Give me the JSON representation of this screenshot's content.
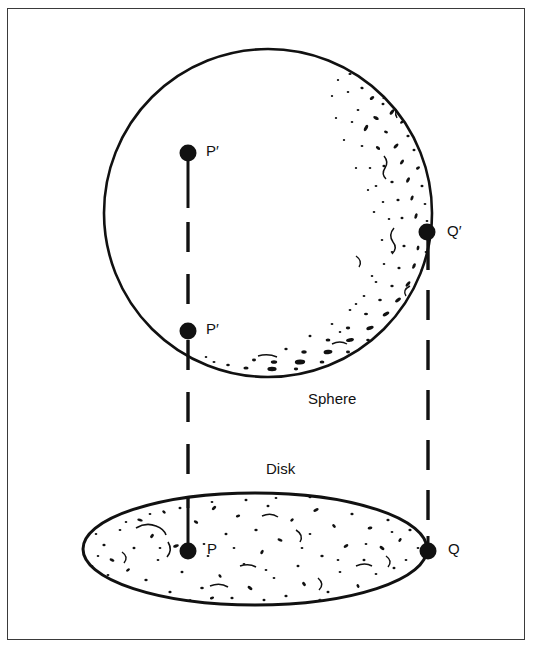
{
  "figure": {
    "background_color": "#ffffff",
    "ink_color": "#111111",
    "frame_color": "#3a3a3a",
    "shapes": {
      "sphere": {
        "label": "Sphere",
        "center_x": 268,
        "center_y": 213,
        "radius": 166,
        "texture": "stipple-crescent-right-bottom"
      },
      "disk": {
        "label": "Disk",
        "center_x": 255,
        "center_y": 549,
        "radius_x": 174,
        "radius_y": 57,
        "texture": "stipple-full"
      }
    },
    "points": [
      {
        "id": "p-prime-top",
        "label": "P′",
        "x": 188,
        "y": 153,
        "label_dx": 16,
        "label_dy": -5
      },
      {
        "id": "p-prime-bottom",
        "label": "P′",
        "x": 188,
        "y": 331,
        "label_dx": 16,
        "label_dy": -5
      },
      {
        "id": "q-prime",
        "label": "Q′",
        "x": 427,
        "y": 232,
        "label_dx": 17,
        "label_dy": -4
      },
      {
        "id": "p-disk",
        "label": "P",
        "x": 188,
        "y": 551,
        "label_dx": 17,
        "label_dy": -5
      },
      {
        "id": "q-disk",
        "label": "Q",
        "x": 428,
        "y": 551,
        "label_dx": 17,
        "label_dy": -5
      }
    ],
    "connectors": [
      {
        "id": "p-prime-vertical-solid",
        "style": "solid",
        "x": 188,
        "y1": 153,
        "y2": 206
      },
      {
        "id": "p-prime-vertical-dashed",
        "style": "dashed",
        "x": 188,
        "y1": 206,
        "y2": 331
      },
      {
        "id": "p-to-disk-dashed",
        "style": "dashed",
        "x": 188,
        "y1": 331,
        "y2": 510
      },
      {
        "id": "p-disk-solid",
        "style": "solid",
        "x": 188,
        "y1": 510,
        "y2": 551
      },
      {
        "id": "q-prime-to-q-dashed",
        "style": "dashed",
        "x": 428,
        "y1": 238,
        "y2": 551
      }
    ],
    "labels": {
      "sphere_label": {
        "text": "Sphere",
        "x": 308,
        "y": 391
      },
      "disk_label": {
        "text": "Disk",
        "x": 266,
        "y": 461
      }
    },
    "caption_partial": ""
  }
}
